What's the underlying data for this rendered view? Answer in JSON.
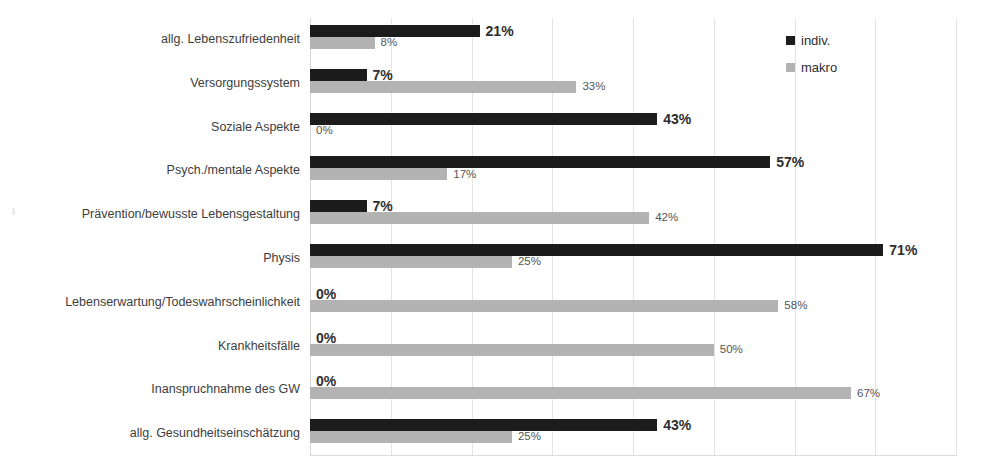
{
  "chart_data": {
    "type": "bar",
    "orientation": "horizontal",
    "title": "",
    "subtitle": "",
    "xlabel": "",
    "ylabel": "",
    "xlim": [
      0,
      80
    ],
    "grid": true,
    "gridline_step": 10,
    "legend_position": "top-right",
    "value_suffix": "%",
    "categories": [
      "allg. Lebenszufriedenheit",
      "Versorgungssystem",
      "Soziale Aspekte",
      "Psych./mentale Aspekte",
      "Prävention/bewusste Lebensgestaltung",
      "Physis",
      "Lebenserwartung/Todeswahrscheinlichkeit",
      "Krankheitsfälle",
      "Inanspruchnahme des GW",
      "allg. Gesundheitseinschätzung"
    ],
    "series": [
      {
        "name": "indiv.",
        "color": "#1c1c1c",
        "values": [
          21,
          7,
          43,
          57,
          7,
          71,
          0,
          0,
          0,
          43
        ],
        "labels": [
          "21%",
          "7%",
          "43%",
          "57%",
          "7%",
          "71%",
          "0%",
          "0%",
          "0%",
          "43%"
        ]
      },
      {
        "name": "makro",
        "color": "#b3b3b3",
        "values": [
          8,
          33,
          0,
          17,
          42,
          25,
          58,
          50,
          67,
          25
        ],
        "labels": [
          "8%",
          "33%",
          "0%",
          "17%",
          "42%",
          "25%",
          "58%",
          "50%",
          "67%",
          "25%"
        ]
      }
    ],
    "axis_ticks": [
      0,
      10,
      20,
      30,
      40,
      50,
      60,
      70,
      80
    ],
    "colors": {
      "indiv": "#1c1c1c",
      "makro": "#b3b3b3",
      "gridline": "#e3e3e3",
      "background": "#ffffff",
      "text": "#3d3d3d"
    }
  },
  "legend": {
    "items": [
      {
        "label": "indiv.",
        "color": "#1c1c1c",
        "marker": "square-marker"
      },
      {
        "label": "makro",
        "color": "#b3b3b3",
        "marker": "square-marker"
      }
    ]
  }
}
